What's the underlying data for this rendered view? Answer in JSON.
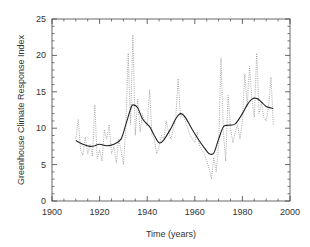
{
  "chart_data": {
    "type": "line",
    "title": "",
    "xlabel": "Time (years)",
    "ylabel": "Greenhouse Climate Response Index",
    "xlim": [
      1900,
      2000
    ],
    "ylim": [
      0,
      25
    ],
    "x_ticks": [
      1900,
      1920,
      1940,
      1960,
      1980,
      2000
    ],
    "y_ticks": [
      0,
      5,
      10,
      15,
      20,
      25
    ],
    "grid": false,
    "legend": null,
    "series": [
      {
        "name": "Annual values",
        "style": "dotted",
        "color": "#888888",
        "x": [
          1910,
          1911,
          1912,
          1913,
          1914,
          1915,
          1916,
          1917,
          1918,
          1919,
          1920,
          1921,
          1922,
          1923,
          1924,
          1925,
          1926,
          1927,
          1928,
          1929,
          1930,
          1931,
          1932,
          1933,
          1934,
          1935,
          1936,
          1937,
          1938,
          1939,
          1940,
          1941,
          1942,
          1943,
          1944,
          1945,
          1946,
          1947,
          1948,
          1949,
          1950,
          1951,
          1952,
          1953,
          1954,
          1955,
          1956,
          1957,
          1958,
          1959,
          1960,
          1961,
          1962,
          1963,
          1964,
          1965,
          1966,
          1967,
          1968,
          1969,
          1970,
          1971,
          1972,
          1973,
          1974,
          1975,
          1976,
          1977,
          1978,
          1979,
          1980,
          1981,
          1982,
          1983,
          1984,
          1985,
          1986,
          1987,
          1988,
          1989,
          1990,
          1991,
          1992,
          1993
        ],
        "y": [
          8.5,
          11.2,
          7.0,
          6.3,
          8.8,
          6.5,
          7.8,
          6.2,
          13.2,
          5.8,
          7.0,
          5.5,
          9.8,
          8.5,
          10.5,
          6.5,
          7.5,
          5.2,
          8.5,
          7.0,
          5.0,
          10.0,
          20.3,
          10.5,
          22.8,
          9.0,
          14.0,
          9.5,
          12.0,
          10.8,
          10.3,
          15.3,
          9.0,
          8.5,
          6.5,
          7.5,
          9.0,
          8.5,
          11.0,
          9.5,
          8.5,
          10.0,
          11.5,
          16.8,
          11.5,
          12.0,
          11.0,
          10.0,
          9.0,
          8.5,
          8.0,
          9.5,
          7.5,
          7.0,
          6.5,
          5.5,
          4.5,
          3.0,
          6.0,
          4.0,
          7.5,
          19.7,
          9.5,
          5.5,
          14.5,
          10.0,
          8.0,
          9.5,
          10.5,
          8.5,
          11.0,
          17.5,
          13.0,
          18.5,
          14.0,
          11.5,
          20.3,
          12.0,
          13.5,
          11.5,
          11.0,
          13.0,
          17.0,
          10.5
        ]
      },
      {
        "name": "Smoothed",
        "style": "solid",
        "color": "#222222",
        "x": [
          1910,
          1913,
          1916,
          1918,
          1920,
          1923,
          1926,
          1929,
          1931,
          1933,
          1934,
          1936,
          1938,
          1941,
          1943,
          1945,
          1947,
          1950,
          1952,
          1954,
          1956,
          1959,
          1962,
          1964,
          1966,
          1968,
          1970,
          1972,
          1974,
          1977,
          1980,
          1982,
          1984,
          1986,
          1988,
          1990,
          1993
        ],
        "y": [
          8.3,
          7.8,
          7.5,
          7.6,
          7.8,
          7.6,
          7.8,
          8.5,
          10.5,
          12.6,
          13.2,
          12.8,
          11.3,
          10.2,
          9.0,
          8.0,
          8.4,
          10.0,
          11.3,
          12.0,
          11.5,
          9.8,
          8.2,
          7.3,
          6.5,
          6.6,
          8.5,
          10.2,
          10.4,
          10.6,
          12.0,
          13.2,
          14.0,
          14.1,
          13.6,
          13.0,
          12.7
        ]
      }
    ]
  }
}
